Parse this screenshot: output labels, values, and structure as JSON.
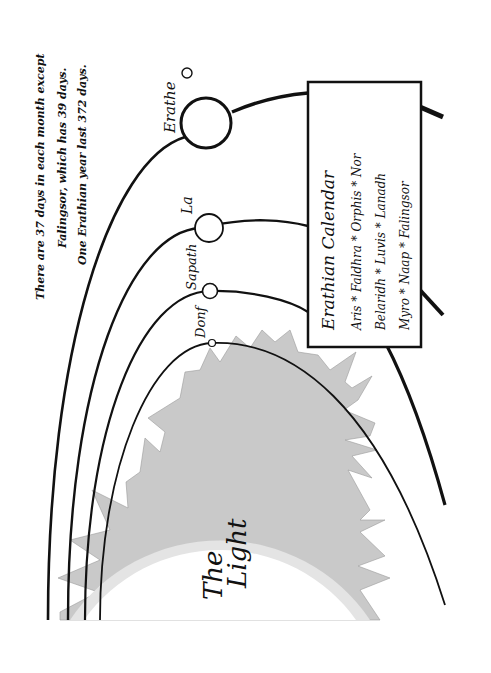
{
  "diagram": {
    "orientation": "rotated-90-ccw",
    "sun": {
      "label_line1": "The",
      "label_line2": "Light",
      "corona_color": "#c8c8c8",
      "glow_color": "#e6e6e6",
      "core_color": "#ffffff"
    },
    "planets": [
      {
        "name": "Donf",
        "order": 1
      },
      {
        "name": "Sapath",
        "order": 2
      },
      {
        "name": "La",
        "order": 3
      },
      {
        "name": "Erathe",
        "order": 4,
        "has_moon": true
      }
    ],
    "notes": {
      "line1": "There are 37 days in each month except",
      "line2": "Falingsor, which has 39 days.",
      "line3": "One Erathian year last 372 days."
    },
    "calendar": {
      "title": "Erathian Calendar",
      "row1": "Aris * Faldhra * Orphis * Nor",
      "row2": "Belaridh * Luvis * Lanadh",
      "row3": "Myro * Naap * Falingsor"
    },
    "colors": {
      "ink": "#111111",
      "background": "#ffffff"
    }
  }
}
